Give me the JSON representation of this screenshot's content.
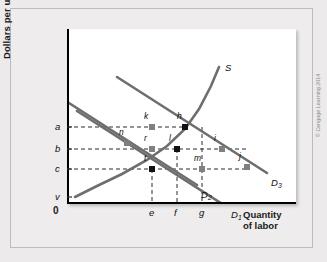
{
  "figure": {
    "y_axis_title": "Dollars per unit",
    "x_axis_title_line1": "Quantity",
    "x_axis_title_line2": "of labor",
    "origin_label": "0",
    "copyright": "© Cengage Learning 2014"
  },
  "chart_data": {
    "type": "line",
    "title": "",
    "xlabel": "Quantity of labor",
    "ylabel": "Dollars per unit",
    "grid": false,
    "legend": "inline-curve-labels",
    "xlim": [
      0,
      229
    ],
    "ylim": [
      0,
      175
    ],
    "y_ticks": [
      {
        "label": "a",
        "value": 98
      },
      {
        "label": "b",
        "value": 120
      },
      {
        "label": "c",
        "value": 140
      },
      {
        "label": "v",
        "value": 168
      }
    ],
    "x_ticks": [
      {
        "label": "e",
        "value": 85
      },
      {
        "label": "f",
        "value": 110
      },
      {
        "label": "g",
        "value": 135
      }
    ],
    "series": [
      {
        "name": "S",
        "kind": "supply",
        "label": "S",
        "points": [
          [
            8,
            168
          ],
          [
            30,
            157
          ],
          [
            55,
            145
          ],
          [
            80,
            131
          ],
          [
            100,
            117
          ],
          [
            118,
            100
          ],
          [
            132,
            80
          ],
          [
            144,
            57
          ],
          [
            152,
            38
          ]
        ]
      },
      {
        "name": "D1",
        "kind": "demand",
        "label": "D",
        "sub": "1",
        "points": [
          [
            10,
            82
          ],
          [
            160,
            178
          ]
        ]
      },
      {
        "name": "D2",
        "kind": "demand",
        "label": "D",
        "sub": "2",
        "points": [
          [
            -20,
            60
          ],
          [
            130,
            156
          ]
        ]
      },
      {
        "name": "D3",
        "kind": "demand",
        "label": "D",
        "sub": "3",
        "points": [
          [
            50,
            48
          ],
          [
            200,
            144
          ]
        ]
      }
    ],
    "points": [
      {
        "label": "n",
        "x": 60,
        "y": 114,
        "filled": false,
        "anchor": "above"
      },
      {
        "label": "k",
        "x": 85,
        "y": 98,
        "filled": false,
        "anchor": "above"
      },
      {
        "label": "h",
        "x": 118,
        "y": 98,
        "filled": true,
        "anchor": "above"
      },
      {
        "label": "r",
        "x": 85,
        "y": 120,
        "filled": false,
        "anchor": "above"
      },
      {
        "label": "l",
        "x": 110,
        "y": 120,
        "filled": true,
        "anchor": "above"
      },
      {
        "label": "i",
        "x": 155,
        "y": 120,
        "filled": false,
        "anchor": "above"
      },
      {
        "label": "t",
        "x": 85,
        "y": 140,
        "filled": true,
        "anchor": "above"
      },
      {
        "label": "m",
        "x": 135,
        "y": 140,
        "filled": false,
        "anchor": "above"
      },
      {
        "label": "j",
        "x": 180,
        "y": 138,
        "filled": false,
        "anchor": "above"
      }
    ],
    "guides": {
      "horizontal": [
        {
          "from_label": "a",
          "y": 98
        },
        {
          "from_label": "b",
          "y": 120
        },
        {
          "from_label": "c",
          "y": 140
        }
      ],
      "vertical": [
        {
          "from_label": "e",
          "x": 85
        },
        {
          "from_label": "f",
          "x": 110
        },
        {
          "from_label": "g",
          "x": 135
        }
      ]
    },
    "curve_labels": [
      {
        "text": "S",
        "x": 158,
        "y": 33
      },
      {
        "text": "D",
        "sub": "3",
        "x": 204,
        "y": 148
      },
      {
        "text": "D",
        "sub": "1",
        "x": 164,
        "y": 180
      },
      {
        "text": "D",
        "sub": "2",
        "x": 134,
        "y": 160
      }
    ]
  }
}
